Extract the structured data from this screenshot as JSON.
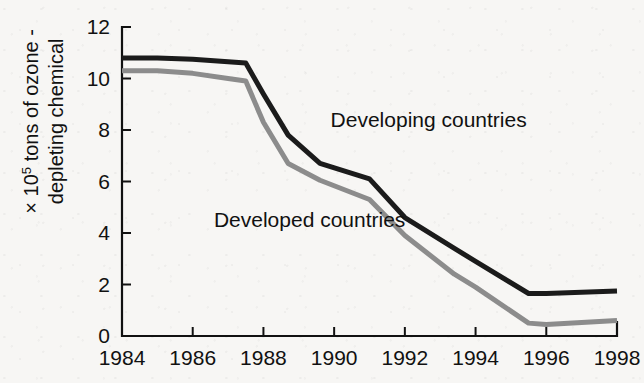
{
  "chart_data": {
    "type": "line",
    "title": "",
    "subtitle": "",
    "xlabel": "",
    "ylabel": "× 10⁵ tons of ozone-depleting chemical",
    "ylabel_lines": [
      {
        "prefix": "× 10",
        "exponent": "5",
        "suffix": " tons of ozone -"
      },
      {
        "prefix": "depleting chemical",
        "exponent": "",
        "suffix": ""
      }
    ],
    "x": [
      1984,
      1985,
      1986,
      1987,
      1987.5,
      1988,
      1988.7,
      1989.6,
      1991,
      1992,
      1993.4,
      1994,
      1995.5,
      1996,
      1998
    ],
    "xlim": [
      1984,
      1998
    ],
    "ylim": [
      0,
      12
    ],
    "xticks": [
      1984,
      1986,
      1988,
      1990,
      1992,
      1994,
      1996,
      1998
    ],
    "xtick_labels": [
      "1984",
      "1986",
      "1988",
      "1990",
      "1992",
      "1994",
      "1996",
      "1998"
    ],
    "yticks": [
      0,
      2,
      4,
      6,
      8,
      10,
      12
    ],
    "ytick_labels": [
      "0",
      "2",
      "4",
      "6",
      "8",
      "10",
      "12"
    ],
    "grid": false,
    "legend_position": "inline-annotation",
    "series": [
      {
        "name": "Developing countries",
        "color": "#1b1b1b",
        "line_width": 5,
        "annotation": "Developing countries",
        "annotation_x": 1989.9,
        "annotation_y": 8.1,
        "values": [
          10.8,
          10.8,
          10.75,
          10.65,
          10.6,
          9.4,
          7.8,
          6.7,
          6.1,
          4.6,
          3.4,
          2.9,
          1.65,
          1.65,
          1.75
        ]
      },
      {
        "name": "Developed countries",
        "color": "#8c8c8c",
        "line_width": 5,
        "annotation": "Developed countries",
        "annotation_x": 1986.6,
        "annotation_y": 4.25,
        "values": [
          10.3,
          10.3,
          10.2,
          10.0,
          9.9,
          8.3,
          6.7,
          6.05,
          5.3,
          3.9,
          2.4,
          1.9,
          0.5,
          0.45,
          0.6
        ]
      }
    ]
  },
  "geometry": {
    "plot_left": 122,
    "plot_right": 617,
    "plot_top": 27,
    "plot_bottom": 336,
    "tick_length": 9
  }
}
